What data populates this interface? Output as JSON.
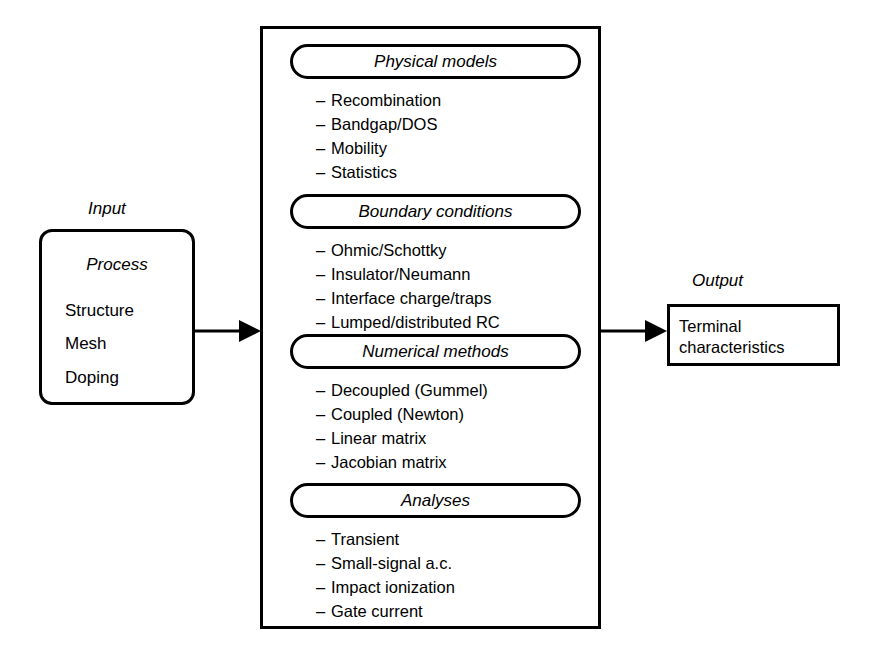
{
  "diagram": {
    "title_labels": {
      "input": "Input",
      "output": "Output"
    },
    "input_box": {
      "title": "Process",
      "items": [
        "Structure",
        "Mesh",
        "Doping"
      ]
    },
    "output_box": {
      "lines": [
        "Terminal",
        "characteristics"
      ]
    },
    "sections": [
      {
        "header": "Physical models",
        "items": [
          "Recombination",
          "Bandgap/DOS",
          "Mobility",
          "Statistics"
        ]
      },
      {
        "header": "Boundary conditions",
        "items": [
          "Ohmic/Schottky",
          "Insulator/Neumann",
          "Interface charge/traps",
          "Lumped/distributed RC"
        ]
      },
      {
        "header": "Numerical methods",
        "items": [
          "Decoupled (Gummel)",
          "Coupled (Newton)",
          "Linear matrix",
          "Jacobian matrix"
        ]
      },
      {
        "header": "Analyses",
        "items": [
          "Transient",
          "Small-signal a.c.",
          "Impact ionization",
          "Gate current"
        ]
      }
    ],
    "bullet_marker": "–",
    "colors": {
      "stroke": "#000000",
      "background": "#ffffff"
    }
  }
}
